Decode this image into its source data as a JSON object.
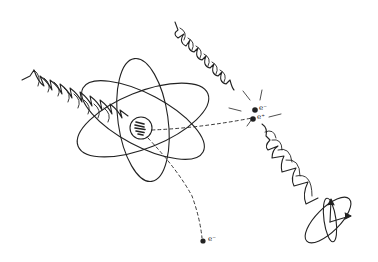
{
  "diagram": {
    "colors": {
      "ink": "#222222",
      "background": "#ffffff"
    },
    "elements": {
      "atom": {
        "orbits": 3,
        "nucleus": "nucleus with wave packet inside"
      },
      "incident_wave_left": {
        "type": "photon wave train",
        "direction": "toward nucleus"
      },
      "incident_wave_top": {
        "type": "photon wave train",
        "direction": "toward pair-production point"
      },
      "outgoing_wave": {
        "type": "polarized wave with arrow",
        "direction": "down-right"
      },
      "ejected_electron": {
        "label": "e⁻"
      },
      "pair": {
        "electron_label": "e⁻",
        "positron_label": "e⁺"
      }
    }
  }
}
